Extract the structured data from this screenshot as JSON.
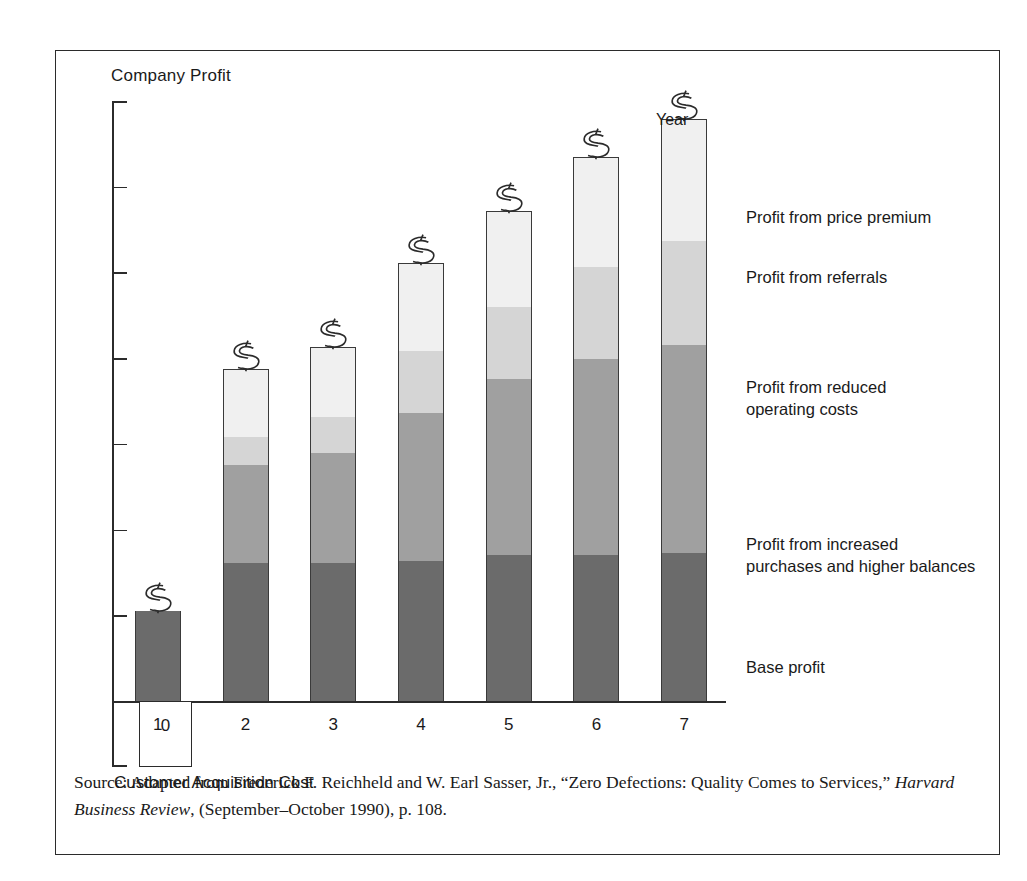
{
  "chart_data": {
    "type": "bar",
    "subtype": "stacked-bar",
    "title": "Company Profit",
    "ylabel": "Company Profit",
    "xlabel": "Year",
    "categories": [
      "1",
      "2",
      "3",
      "4",
      "5",
      "6",
      "7"
    ],
    "grid": false,
    "legend_position": "right",
    "axis_ticks_count": 7,
    "y_axis_tick_labels": [],
    "series": [
      {
        "name": "Base profit",
        "color": "#6b6b6b",
        "values": [
          90,
          138,
          138,
          140,
          146,
          146,
          148
        ]
      },
      {
        "name": "Profit from increased purchases and higher balances",
        "color": "#a0a0a0",
        "values": [
          0,
          98,
          110,
          148,
          176,
          196,
          208
        ]
      },
      {
        "name": "Profit from reduced operating costs",
        "color": "#d5d5d5",
        "values": [
          0,
          28,
          36,
          62,
          72,
          92,
          104
        ]
      },
      {
        "name": "Profit from price premium",
        "color": "#f0f0f0",
        "values": [
          0,
          68,
          70,
          88,
          96,
          110,
          122
        ]
      }
    ],
    "below_axis": {
      "label": "0",
      "annotation": "Customer Acquisition Cost"
    },
    "annotations": [
      "Each bar is topped with a dollar-sign symbol"
    ]
  },
  "axis": {
    "y_title": "Company Profit",
    "x_title": "Year",
    "zero_box_label": "0",
    "cac_label": "Customer Acquisition Cost",
    "year_labels": [
      "1",
      "2",
      "3",
      "4",
      "5",
      "6",
      "7"
    ]
  },
  "legend": {
    "items": [
      {
        "label": "Profit from price premium",
        "color": "#f0f0f0"
      },
      {
        "label": "Profit from referrals",
        "color": "#f0f0f0"
      },
      {
        "label": "Profit from reduced\noperating costs",
        "color": "#d5d5d5"
      },
      {
        "label": "Profit from increased\npurchases and higher balances",
        "color": "#a0a0a0"
      },
      {
        "label": "Base profit",
        "color": "#6b6b6b"
      }
    ]
  },
  "source": {
    "prefix": "Source: Adapted from Frederick F. Reichheld and W. Earl Sasser, Jr., “Zero Defections: Quality Comes to Services,” ",
    "italic": "Harvard Business Review",
    "suffix": ", (September–October 1990), p. 108."
  },
  "icons": {
    "money": "dollar-sign-icon"
  },
  "colors": {
    "base_profit": "#6b6b6b",
    "increased_purchases": "#a0a0a0",
    "reduced_operating_costs": "#d5d5d5",
    "price_premium": "#f0f0f0",
    "ink": "#2b2b2b",
    "page": "#ffffff"
  }
}
